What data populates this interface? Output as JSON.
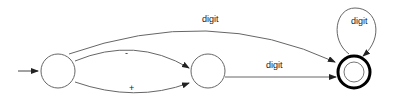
{
  "diagram": {
    "type": "finite-state-automaton",
    "states": [
      {
        "id": "s0",
        "role": "start",
        "accepting": false
      },
      {
        "id": "s1",
        "role": "intermediate",
        "accepting": false
      },
      {
        "id": "s2",
        "role": "final",
        "accepting": true
      }
    ],
    "transitions": [
      {
        "from": "s0",
        "to": "s2",
        "label": "digit"
      },
      {
        "from": "s0",
        "to": "s1",
        "label": "-"
      },
      {
        "from": "s0",
        "to": "s1",
        "label": "+"
      },
      {
        "from": "s1",
        "to": "s2",
        "label": "digit"
      },
      {
        "from": "s2",
        "to": "s2",
        "label": "digit"
      }
    ],
    "labels": {
      "top_arc": "digit",
      "minus_arc": "-",
      "plus_arc": "+",
      "middle_edge": "digit",
      "self_loop": "digit"
    },
    "colors": {
      "stroke": "#555555",
      "final_stroke": "#000000"
    }
  }
}
